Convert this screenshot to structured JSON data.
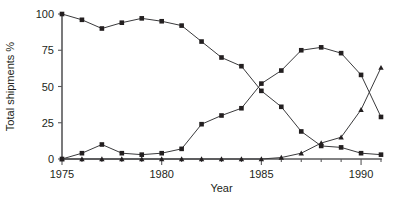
{
  "chart_data": {
    "type": "line",
    "title": "",
    "subtitle": "",
    "xlabel": "Year",
    "ylabel": "Total shipments %",
    "xlim": [
      1975,
      1991
    ],
    "ylim": [
      0,
      100
    ],
    "xticks": [
      1975,
      1980,
      1985,
      1990
    ],
    "yticks": [
      0,
      25,
      50,
      75,
      100
    ],
    "xtick_labels": [
      "1975",
      "1980",
      "1985",
      "1990"
    ],
    "ytick_labels": [
      "0",
      "25",
      "50",
      "75",
      "100"
    ],
    "grid": false,
    "legend": "none",
    "x": [
      1975,
      1976,
      1977,
      1978,
      1979,
      1980,
      1981,
      1982,
      1983,
      1984,
      1985,
      1986,
      1987,
      1988,
      1989,
      1990,
      1991
    ],
    "series": [
      {
        "name": "declining-series",
        "marker": "square",
        "values": [
          100,
          96,
          90,
          94,
          97,
          95,
          92,
          81,
          70,
          64,
          47,
          36,
          19,
          9,
          8,
          4,
          3
        ]
      },
      {
        "name": "rising-peak-series",
        "marker": "square",
        "values": [
          0,
          4,
          10,
          4,
          3,
          4,
          7,
          24,
          30,
          35,
          52,
          61,
          75,
          77,
          73,
          58,
          29
        ]
      },
      {
        "name": "late-rising-series",
        "marker": "triangle",
        "values": [
          0,
          0,
          0,
          0,
          0,
          0,
          0,
          0,
          0,
          0,
          0,
          1,
          4,
          11,
          15,
          34,
          63
        ]
      }
    ]
  }
}
